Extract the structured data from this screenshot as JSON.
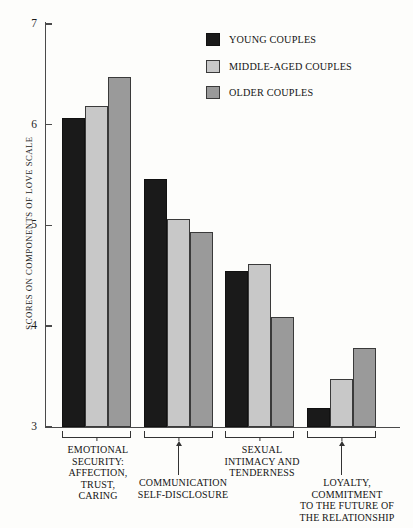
{
  "chart_data": {
    "type": "bar",
    "title": "",
    "xlabel": "",
    "ylabel": "SCORES ON COMPONENTS OF LOVE SCALE",
    "ylim": [
      3,
      7
    ],
    "yticks": [
      3,
      4,
      5,
      6,
      7
    ],
    "grid": false,
    "legend_position": "top-right",
    "categories": [
      "EMOTIONAL SECURITY: AFFECTION, TRUST, CARING",
      "COMMUNICATION SELF-DISCLOSURE",
      "SEXUAL INTIMACY AND TENDERNESS",
      "LOYALTY, COMMITMENT TO THE FUTURE OF THE RELATIONSHIP"
    ],
    "category_label_lines": [
      [
        "EMOTIONAL",
        "SECURITY:",
        "AFFECTION,",
        "TRUST,",
        "CARING"
      ],
      [
        "COMMUNICATION",
        "SELF-DISCLOSURE"
      ],
      [
        "SEXUAL",
        "INTIMACY AND",
        "TENDERNESS"
      ],
      [
        "LOYALTY,",
        "COMMITMENT",
        "TO THE FUTURE OF",
        "THE RELATIONSHIP"
      ]
    ],
    "series": [
      {
        "name": "YOUNG COUPLES",
        "color": "#1a1a1a",
        "values": [
          6.07,
          5.46,
          4.55,
          3.18
        ]
      },
      {
        "name": "MIDDLE-AGED COUPLES",
        "color": "#c8c8c8",
        "values": [
          6.19,
          5.06,
          4.62,
          3.47
        ]
      },
      {
        "name": "OLDER COUPLES",
        "color": "#9a9a9a",
        "values": [
          6.47,
          4.93,
          4.09,
          3.78
        ]
      }
    ]
  },
  "legend": {
    "items": [
      {
        "label": "YOUNG COUPLES",
        "swatch": "series-young"
      },
      {
        "label": "MIDDLE-AGED COUPLES",
        "swatch": "series-middle"
      },
      {
        "label": "OLDER COUPLES",
        "swatch": "series-older"
      }
    ]
  },
  "axis": {
    "y_title": "SCORES ON COMPONENTS OF LOVE SCALE",
    "tick_labels": [
      "7",
      "6",
      "5",
      "4",
      "3"
    ]
  }
}
